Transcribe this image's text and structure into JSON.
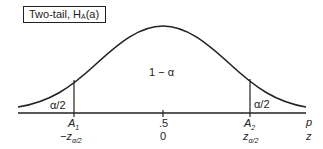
{
  "title_box": {
    "text": "Two-tail, H",
    "sub": "A",
    "suffix": "(a)"
  },
  "regions": {
    "center": "1 − α",
    "left_tail": "α/2",
    "right_tail": "α/2"
  },
  "axis_labels": {
    "top_axis_var": "p",
    "bottom_axis_var": "z"
  },
  "ticks": [
    {
      "top": "A",
      "top_sub": "1",
      "bottom": "−z",
      "bottom_sub": "α/2"
    },
    {
      "top": ".5",
      "bottom": "0"
    },
    {
      "top": "A",
      "top_sub": "2",
      "bottom": "z",
      "bottom_sub": "α/2"
    }
  ],
  "colors": {
    "ink": "#222222",
    "background": "#ffffff"
  }
}
